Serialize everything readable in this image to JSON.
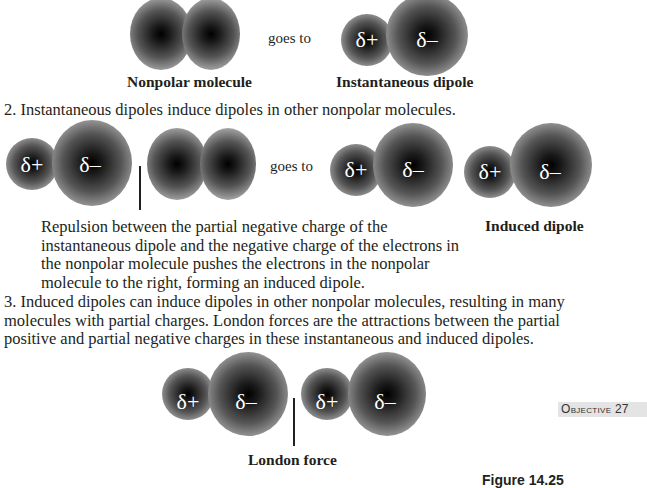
{
  "step1": {
    "nonpolar_caption": "Nonpolar molecule",
    "goes_to": "goes to",
    "dipole_caption": "Instantaneous dipole",
    "partial_positive": "δ+",
    "partial_negative": "δ–"
  },
  "step2": {
    "heading": "2. Instantaneous dipoles induce dipoles in other nonpolar molecules.",
    "goes_to": "goes to",
    "partial_positive": "δ+",
    "partial_negative": "δ–",
    "explanation": "Repulsion between the partial negative charge of the instantaneous dipole and the negative charge of the electrons in the nonpolar molecule pushes the electrons in the nonpolar molecule to the right, forming an induced dipole.",
    "induced_caption": "Induced dipole"
  },
  "step3": {
    "text": "3. Induced dipoles can induce dipoles in other nonpolar molecules, resulting in many molecules with partial charges. London forces are the attractions between the partial positive and partial negative charges in these instantaneous and induced dipoles.",
    "partial_positive": "δ+",
    "partial_negative": "δ–",
    "london_caption": "London force"
  },
  "sidebar": {
    "objective": "Objective 27",
    "figure_label": "Figure 14.25"
  }
}
